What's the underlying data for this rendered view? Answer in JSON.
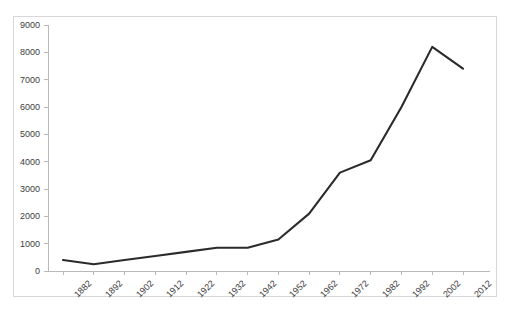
{
  "chart_data": {
    "type": "line",
    "title": "",
    "xlabel": "",
    "ylabel": "",
    "categories": [
      "1882",
      "1892",
      "1902",
      "1912",
      "1922",
      "1932",
      "1942",
      "1952",
      "1962",
      "1972",
      "1982",
      "1992",
      "2002",
      "2012"
    ],
    "values": [
      400,
      250,
      400,
      550,
      700,
      850,
      850,
      1150,
      2100,
      3600,
      4050,
      6000,
      8200,
      7400
    ],
    "series": [
      {
        "name": "series-1",
        "values": [
          400,
          250,
          400,
          550,
          700,
          850,
          850,
          1150,
          2100,
          3600,
          4050,
          6000,
          8200,
          7400
        ]
      }
    ],
    "ylim": [
      0,
      9000
    ],
    "y_ticks": [
      0,
      1000,
      2000,
      3000,
      4000,
      5000,
      6000,
      7000,
      8000,
      9000
    ],
    "y_tick_labels": [
      "0",
      "1000",
      "2000",
      "3000",
      "4000",
      "5000",
      "6000",
      "7000",
      "8000",
      "9000"
    ],
    "grid": false,
    "legend": "none",
    "line_color": "#2b2b2b",
    "plot_background": "#ffffff",
    "border_color": "#d7d7db",
    "axis_color": "#b9b9bd",
    "x_tick_rotation": -45
  },
  "figure": {
    "clipped_title": ""
  }
}
